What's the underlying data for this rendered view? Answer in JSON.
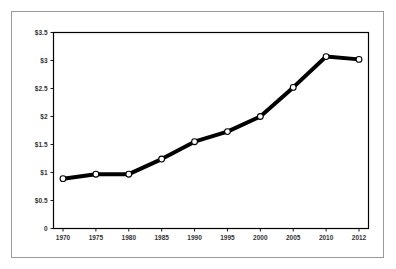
{
  "chart_data": {
    "type": "line",
    "title": "",
    "subtitle": "",
    "xlabel": "",
    "ylabel": "",
    "categories": [
      "1970",
      "1975",
      "1980",
      "1985",
      "1990",
      "1995",
      "2000",
      "2005",
      "2010",
      "2012"
    ],
    "values": [
      0.89,
      0.97,
      0.97,
      1.24,
      1.55,
      1.73,
      2.0,
      2.52,
      3.07,
      3.02
    ],
    "x": [
      1970,
      1975,
      1980,
      1985,
      1990,
      1995,
      2000,
      2005,
      2010,
      2012
    ],
    "ylim": [
      0,
      3.5
    ],
    "ytick_values": [
      0,
      0.5,
      1,
      1.5,
      2,
      2.5,
      3,
      3.5
    ],
    "ytick_labels": [
      "0",
      "$0.5",
      "$1",
      "$1.5",
      "$2",
      "$2.5",
      "$3",
      "$3.5"
    ],
    "xtick_labels": [
      "1970",
      "1975",
      "1980",
      "1985",
      "1990",
      "1995",
      "2000",
      "2005",
      "2010",
      "2012"
    ],
    "grid": false,
    "legend": null,
    "legend_position": "none",
    "marker": "open-circle",
    "line_color": "#000000",
    "marker_fill": "#ffffff",
    "annotations": []
  },
  "frame": {
    "outer_border_color": "#9a9a9a",
    "plot_border_color": "#000000",
    "background_color": "#ffffff"
  }
}
